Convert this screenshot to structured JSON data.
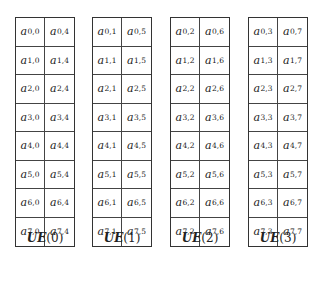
{
  "diagram": {
    "units": [
      {
        "label_prefix": "UE",
        "label_index": "(0)",
        "rows": [
          [
            {
              "base": "a",
              "sub": "0,0"
            },
            {
              "base": "a",
              "sub": "0,4"
            }
          ],
          [
            {
              "base": "a",
              "sub": "1,0"
            },
            {
              "base": "a",
              "sub": "1,4"
            }
          ],
          [
            {
              "base": "a",
              "sub": "2,0"
            },
            {
              "base": "a",
              "sub": "2,4"
            }
          ],
          [
            {
              "base": "a",
              "sub": "3,0"
            },
            {
              "base": "a",
              "sub": "3,4"
            }
          ],
          [
            {
              "base": "a",
              "sub": "4,0"
            },
            {
              "base": "a",
              "sub": "4,4"
            }
          ],
          [
            {
              "base": "a",
              "sub": "5,0"
            },
            {
              "base": "a",
              "sub": "5,4"
            }
          ],
          [
            {
              "base": "a",
              "sub": "6,0"
            },
            {
              "base": "a",
              "sub": "6,4"
            }
          ],
          [
            {
              "base": "a",
              "sub": "7,0"
            },
            {
              "base": "a",
              "sub": "7,4"
            }
          ]
        ]
      },
      {
        "label_prefix": "UE",
        "label_index": "(1)",
        "rows": [
          [
            {
              "base": "a",
              "sub": "0,1"
            },
            {
              "base": "a",
              "sub": "0,5"
            }
          ],
          [
            {
              "base": "a",
              "sub": "1,1"
            },
            {
              "base": "a",
              "sub": "1,5"
            }
          ],
          [
            {
              "base": "a",
              "sub": "2,1"
            },
            {
              "base": "a",
              "sub": "2,5"
            }
          ],
          [
            {
              "base": "a",
              "sub": "3,1"
            },
            {
              "base": "a",
              "sub": "3,5"
            }
          ],
          [
            {
              "base": "a",
              "sub": "4,1"
            },
            {
              "base": "a",
              "sub": "4,5"
            }
          ],
          [
            {
              "base": "a",
              "sub": "5,1"
            },
            {
              "base": "a",
              "sub": "5,5"
            }
          ],
          [
            {
              "base": "a",
              "sub": "6,1"
            },
            {
              "base": "a",
              "sub": "6,5"
            }
          ],
          [
            {
              "base": "a",
              "sub": "7,1"
            },
            {
              "base": "a",
              "sub": "7,5"
            }
          ]
        ]
      },
      {
        "label_prefix": "UE",
        "label_index": "(2)",
        "rows": [
          [
            {
              "base": "a",
              "sub": "0,2"
            },
            {
              "base": "a",
              "sub": "0,6"
            }
          ],
          [
            {
              "base": "a",
              "sub": "1,2"
            },
            {
              "base": "a",
              "sub": "1,6"
            }
          ],
          [
            {
              "base": "a",
              "sub": "2,2"
            },
            {
              "base": "a",
              "sub": "2,6"
            }
          ],
          [
            {
              "base": "a",
              "sub": "3,2"
            },
            {
              "base": "a",
              "sub": "3,6"
            }
          ],
          [
            {
              "base": "a",
              "sub": "4,2"
            },
            {
              "base": "a",
              "sub": "4,6"
            }
          ],
          [
            {
              "base": "a",
              "sub": "5,2"
            },
            {
              "base": "a",
              "sub": "5,6"
            }
          ],
          [
            {
              "base": "a",
              "sub": "6,2"
            },
            {
              "base": "a",
              "sub": "6,6"
            }
          ],
          [
            {
              "base": "a",
              "sub": "7,2"
            },
            {
              "base": "a",
              "sub": "7,6"
            }
          ]
        ]
      },
      {
        "label_prefix": "UE",
        "label_index": "(3)",
        "rows": [
          [
            {
              "base": "a",
              "sub": "0,3"
            },
            {
              "base": "a",
              "sub": "0,7"
            }
          ],
          [
            {
              "base": "a",
              "sub": "1,3"
            },
            {
              "base": "a",
              "sub": "1,7"
            }
          ],
          [
            {
              "base": "a",
              "sub": "2,3"
            },
            {
              "base": "a",
              "sub": "2,7"
            }
          ],
          [
            {
              "base": "a",
              "sub": "3,3"
            },
            {
              "base": "a",
              "sub": "3,7"
            }
          ],
          [
            {
              "base": "a",
              "sub": "4,3"
            },
            {
              "base": "a",
              "sub": "4,7"
            }
          ],
          [
            {
              "base": "a",
              "sub": "5,3"
            },
            {
              "base": "a",
              "sub": "5,7"
            }
          ],
          [
            {
              "base": "a",
              "sub": "6,3"
            },
            {
              "base": "a",
              "sub": "6,7"
            }
          ],
          [
            {
              "base": "a",
              "sub": "7,3"
            },
            {
              "base": "a",
              "sub": "7,7"
            }
          ]
        ]
      }
    ]
  }
}
